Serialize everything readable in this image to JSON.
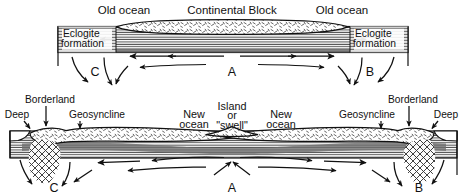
{
  "figure": {
    "background_color": "#ffffff",
    "ink_color": "#111111",
    "crust_fill": "#ffffff",
    "mantle_band_color": "#6a6a6a",
    "hatch_color": "#555555"
  },
  "panels": [
    {
      "id": "upper",
      "name": "initial-stage",
      "labels": {
        "ocean_left": "Old ocean",
        "continent": "Continental Block",
        "ocean_right": "Old ocean",
        "eclogite_left_line1": "Eclogite",
        "eclogite_left_line2": "formation",
        "eclogite_right_line1": "Eclogite",
        "eclogite_right_line2": "formation"
      },
      "cells": [
        {
          "id": "C",
          "label": "C",
          "type": "downwelling",
          "x": 95
        },
        {
          "id": "A",
          "label": "A",
          "type": "upwelling",
          "x": 232
        },
        {
          "id": "B",
          "label": "B",
          "type": "downwelling",
          "x": 370
        }
      ],
      "flow_description": "Mantle rises at A beneath the continental block and spreads outward, descending at C on the left and B on the right."
    },
    {
      "id": "lower",
      "name": "drifted-stage",
      "labels": {
        "deep_left": "Deep",
        "borderland_left": "Borderland",
        "geosyncline_left": "Geosyncline",
        "new_ocean_left": "New ocean",
        "island_line1": "Island",
        "island_line2": "or",
        "island_line3": "\"swell\"",
        "new_ocean_right": "New ocean",
        "geosyncline_right": "Geosyncline",
        "borderland_right": "Borderland",
        "deep_right": "Deep"
      },
      "cells": [
        {
          "id": "C",
          "label": "C",
          "type": "downwelling",
          "x": 54
        },
        {
          "id": "A",
          "label": "A",
          "type": "upwelling",
          "x": 232
        },
        {
          "id": "B",
          "label": "B",
          "type": "downwelling",
          "x": 419
        }
      ],
      "flow_description": "Continent has split; new ocean basins flank a central island or swell above the rising limb A, with downwelling and deeps at the borderlands C and B."
    }
  ]
}
